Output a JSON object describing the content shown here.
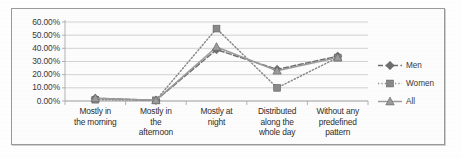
{
  "chart_data": {
    "type": "line",
    "title": "",
    "subtitle": "",
    "xlabel": "",
    "ylabel": "",
    "categories": [
      "Mostly in the morning",
      "Mostly in the afternoon",
      "Mostly at night",
      "Distributed along the whole day",
      "Without any predefined pattern"
    ],
    "category_lines": [
      [
        "Mostly in",
        "the morning"
      ],
      [
        "Mostly in",
        "the",
        "afternoon"
      ],
      [
        "Mostly at",
        "night"
      ],
      [
        "Distributed",
        "along the",
        "whole day"
      ],
      [
        "Without any",
        "predefined",
        "pattern"
      ]
    ],
    "series": [
      {
        "name": "Men",
        "values": [
          2.0,
          0.5,
          39.0,
          24.0,
          34.0
        ],
        "line_style": "dashed",
        "marker": "diamond",
        "color": "#6e6e6e"
      },
      {
        "name": "Women",
        "values": [
          1.0,
          0.5,
          55.0,
          10.0,
          33.0
        ],
        "line_style": "dotted",
        "marker": "square",
        "color": "#8a8a8a"
      },
      {
        "name": "All",
        "values": [
          2.0,
          0.5,
          41.0,
          23.0,
          33.0
        ],
        "line_style": "solid",
        "marker": "triangle",
        "color": "#9c9c9c"
      }
    ],
    "ylim": [
      0,
      60
    ],
    "ytick_values": [
      0,
      10,
      20,
      30,
      40,
      50,
      60
    ],
    "ytick_labels": [
      "0.00%",
      "10.00%",
      "20.00%",
      "30.00%",
      "40.00%",
      "50.00%",
      "60.00%"
    ],
    "grid": true,
    "grid_axis": "y",
    "legend": true,
    "legend_position": "right",
    "legend_entries": [
      "Men",
      "Women",
      "All"
    ],
    "plot_background": "#ffffff",
    "grid_color": "#c8c8c8",
    "axis_color": "#aaaaaa",
    "frame_border_color": "#9a9a9a"
  }
}
